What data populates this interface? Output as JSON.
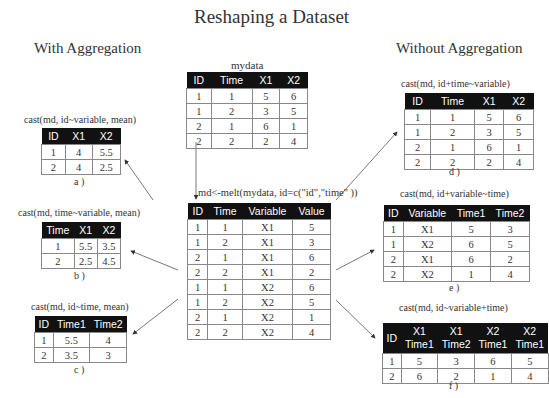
{
  "title": "Reshaping a Dataset",
  "sections": {
    "left": "With Aggregation",
    "right": "Without Aggregation"
  },
  "mydata": {
    "label": "mydata",
    "headers": [
      "ID",
      "Time",
      "X1",
      "X2"
    ],
    "rows": [
      [
        "1",
        "1",
        "5",
        "6"
      ],
      [
        "1",
        "2",
        "3",
        "5"
      ],
      [
        "2",
        "1",
        "6",
        "1"
      ],
      [
        "2",
        "2",
        "2",
        "4"
      ]
    ]
  },
  "melt": {
    "label": "md<-melt(mydata, id=c(\"id\",\"time\" ))",
    "headers": [
      "ID",
      "Time",
      "Variable",
      "Value"
    ],
    "rows": [
      [
        "1",
        "1",
        "X1",
        "5"
      ],
      [
        "1",
        "2",
        "X1",
        "3"
      ],
      [
        "2",
        "1",
        "X1",
        "6"
      ],
      [
        "2",
        "2",
        "X1",
        "2"
      ],
      [
        "1",
        "1",
        "X2",
        "6"
      ],
      [
        "1",
        "2",
        "X2",
        "5"
      ],
      [
        "2",
        "1",
        "X2",
        "1"
      ],
      [
        "2",
        "2",
        "X2",
        "4"
      ]
    ]
  },
  "a": {
    "label": "cast(md, id~variable, mean)",
    "caption": "a )",
    "headers": [
      "ID",
      "X1",
      "X2"
    ],
    "rows": [
      [
        "1",
        "4",
        "5.5"
      ],
      [
        "2",
        "4",
        "2.5"
      ]
    ]
  },
  "b": {
    "label": "cast(md, time~variable, mean)",
    "caption": "b )",
    "headers": [
      "Time",
      "X1",
      "X2"
    ],
    "rows": [
      [
        "1",
        "5.5",
        "3.5"
      ],
      [
        "2",
        "2.5",
        "4.5"
      ]
    ]
  },
  "c": {
    "label": "cast(md, id~time, mean)",
    "caption": "c )",
    "headers": [
      "ID",
      "Time1",
      "Time2"
    ],
    "rows": [
      [
        "1",
        "5.5",
        "4"
      ],
      [
        "2",
        "3.5",
        "3"
      ]
    ]
  },
  "d": {
    "label": "cast(md, id+time~variable)",
    "caption": "d )",
    "headers": [
      "ID",
      "Time",
      "X1",
      "X2"
    ],
    "rows": [
      [
        "1",
        "1",
        "5",
        "6"
      ],
      [
        "1",
        "2",
        "3",
        "5"
      ],
      [
        "2",
        "1",
        "6",
        "1"
      ],
      [
        "2",
        "2",
        "2",
        "4"
      ]
    ]
  },
  "e": {
    "label": "cast(md, id+variable~time)",
    "caption": "e )",
    "headers": [
      "ID",
      "Variable",
      "Time1",
      "Time2"
    ],
    "rows": [
      [
        "1",
        "X1",
        "5",
        "3"
      ],
      [
        "1",
        "X2",
        "6",
        "5"
      ],
      [
        "2",
        "X1",
        "6",
        "2"
      ],
      [
        "2",
        "X2",
        "1",
        "4"
      ]
    ]
  },
  "f": {
    "label": "cast(md, id~variable+time)",
    "caption": "f )",
    "headers": [
      "ID",
      "X1\nTime1",
      "X1\nTime2",
      "X2\nTime1",
      "X2\nTime1"
    ],
    "header_top": [
      "",
      "X1",
      "X1",
      "X2",
      "X2"
    ],
    "header_bottom": [
      "ID",
      "Time1",
      "Time2",
      "Time1",
      "Time1"
    ],
    "rows": [
      [
        "1",
        "5",
        "3",
        "6",
        "5"
      ],
      [
        "2",
        "6",
        "2",
        "1",
        "4"
      ]
    ]
  }
}
